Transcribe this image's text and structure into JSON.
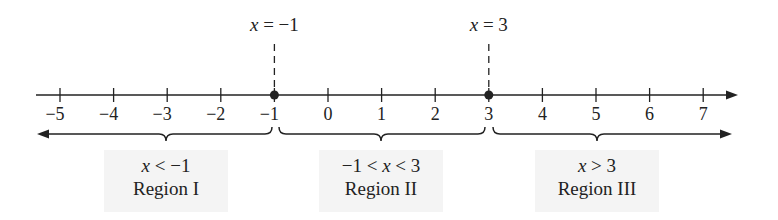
{
  "chart_data": {
    "type": "number-line",
    "title": "",
    "axis": {
      "min": -5,
      "max": 7,
      "ticks": [
        -5,
        -4,
        -3,
        -2,
        -1,
        0,
        1,
        2,
        3,
        4,
        5,
        6,
        7
      ],
      "tick_labels": [
        "−5",
        "−4",
        "−3",
        "−2",
        "−1",
        "0",
        "1",
        "2",
        "3",
        "4",
        "5",
        "6",
        "7"
      ],
      "arrow_right": true
    },
    "critical_points": [
      {
        "value": -1,
        "label": "x = −1",
        "label_var": "x",
        "label_rest": " = −1"
      },
      {
        "value": 3,
        "label": "x = 3",
        "label_var": "x",
        "label_rest": " = 3"
      }
    ],
    "regions": [
      {
        "name": "Region I",
        "inequality": "x < −1",
        "from": null,
        "to": -1,
        "arrow_left": true
      },
      {
        "name": "Region II",
        "inequality": "−1 < x < 3",
        "from": -1,
        "to": 3
      },
      {
        "name": "Region III",
        "inequality": "x > 3",
        "from": 3,
        "to": null,
        "arrow_right": true
      }
    ]
  },
  "colors": {
    "ink": "#222222",
    "shade": "#f4f4f4",
    "background": "#ffffff"
  }
}
